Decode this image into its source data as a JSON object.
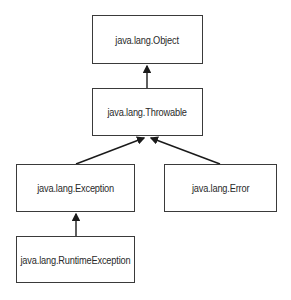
{
  "diagram": {
    "type": "class-hierarchy",
    "nodes": [
      {
        "id": "object",
        "label": "java.lang.Object"
      },
      {
        "id": "throwable",
        "label": "java.lang.Throwable"
      },
      {
        "id": "exception",
        "label": "java.lang.Exception"
      },
      {
        "id": "error",
        "label": "java.lang.Error"
      },
      {
        "id": "runtime",
        "label": "java.lang.RuntimeException"
      }
    ],
    "edges": [
      {
        "from": "throwable",
        "to": "object"
      },
      {
        "from": "exception",
        "to": "throwable"
      },
      {
        "from": "error",
        "to": "throwable"
      },
      {
        "from": "runtime",
        "to": "exception"
      }
    ],
    "colors": {
      "line": "#1a1a1a",
      "border": "#3a3a3a",
      "text": "#2a2a2a",
      "background": "#ffffff"
    }
  }
}
